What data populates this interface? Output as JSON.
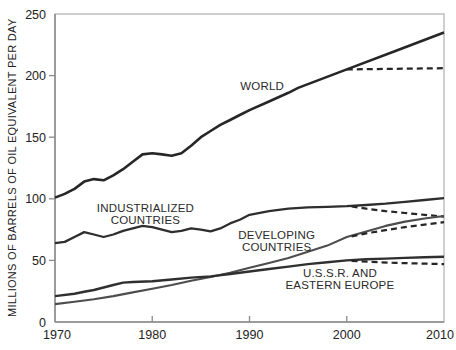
{
  "chart_data": {
    "type": "line",
    "title": "",
    "xlabel": "",
    "ylabel": "MILLIONS OF BARRELS OF OIL EQUIVALENT PER DAY",
    "xlim": [
      1970,
      2010
    ],
    "ylim": [
      0,
      250
    ],
    "x_ticks": [
      1970,
      1980,
      1990,
      2000,
      2010
    ],
    "y_ticks": [
      0,
      50,
      100,
      150,
      200,
      250
    ],
    "grid": false,
    "legend_position": "inline-annotations",
    "axis_color": "#8a8a8a",
    "border_color": "#a8a8a8",
    "series": [
      {
        "name": "WORLD",
        "style": "solid",
        "color": "#262626",
        "width": 2.6,
        "points": [
          [
            1970,
            101
          ],
          [
            1971,
            104
          ],
          [
            1972,
            108
          ],
          [
            1973,
            114
          ],
          [
            1974,
            116
          ],
          [
            1975,
            115
          ],
          [
            1976,
            119
          ],
          [
            1977,
            124
          ],
          [
            1978,
            130
          ],
          [
            1979,
            136
          ],
          [
            1980,
            137
          ],
          [
            1981,
            136
          ],
          [
            1982,
            135
          ],
          [
            1983,
            137
          ],
          [
            1984,
            143
          ],
          [
            1985,
            150
          ],
          [
            1986,
            155
          ],
          [
            1987,
            160
          ],
          [
            1988,
            164
          ],
          [
            1989,
            168
          ],
          [
            1990,
            172
          ],
          [
            1992,
            179
          ],
          [
            1994,
            186
          ],
          [
            1995,
            190
          ],
          [
            2000,
            205
          ],
          [
            2005,
            220
          ],
          [
            2010,
            235
          ]
        ]
      },
      {
        "name": "WORLD (projection)",
        "style": "dashed",
        "color": "#262626",
        "width": 2.2,
        "points": [
          [
            2000,
            205
          ],
          [
            2010,
            206
          ]
        ]
      },
      {
        "name": "INDUSTRIALIZED COUNTRIES",
        "style": "solid",
        "color": "#2e2e2e",
        "width": 2.3,
        "points": [
          [
            1970,
            64
          ],
          [
            1971,
            65
          ],
          [
            1972,
            69
          ],
          [
            1973,
            73
          ],
          [
            1974,
            71
          ],
          [
            1975,
            69
          ],
          [
            1976,
            71
          ],
          [
            1977,
            74
          ],
          [
            1978,
            76
          ],
          [
            1979,
            78
          ],
          [
            1980,
            77
          ],
          [
            1981,
            75
          ],
          [
            1982,
            73
          ],
          [
            1983,
            74
          ],
          [
            1984,
            76
          ],
          [
            1985,
            75
          ],
          [
            1986,
            73.5
          ],
          [
            1987,
            76
          ],
          [
            1988,
            80
          ],
          [
            1989,
            83
          ],
          [
            1990,
            87
          ],
          [
            1992,
            90
          ],
          [
            1994,
            92
          ],
          [
            1996,
            93
          ],
          [
            1998,
            93.5
          ],
          [
            2000,
            94
          ],
          [
            2002,
            95
          ],
          [
            2004,
            96
          ],
          [
            2006,
            97.5
          ],
          [
            2008,
            99
          ],
          [
            2010,
            100.5
          ]
        ]
      },
      {
        "name": "INDUSTRIALIZED COUNTRIES (projection)",
        "style": "dashed",
        "color": "#262626",
        "width": 2.2,
        "points": [
          [
            2000.5,
            93.8
          ],
          [
            2002,
            92
          ],
          [
            2004,
            90
          ],
          [
            2006,
            88.5
          ],
          [
            2008,
            87
          ],
          [
            2010,
            85.5
          ]
        ]
      },
      {
        "name": "DEVELOPING COUNTRIES",
        "style": "solid",
        "color": "#4d4d4d",
        "width": 2.1,
        "points": [
          [
            1970,
            14.5
          ],
          [
            1972,
            16.5
          ],
          [
            1974,
            18.5
          ],
          [
            1976,
            21
          ],
          [
            1978,
            24
          ],
          [
            1980,
            27
          ],
          [
            1982,
            30
          ],
          [
            1984,
            33.5
          ],
          [
            1986,
            36.5
          ],
          [
            1988,
            40
          ],
          [
            1990,
            44
          ],
          [
            1992,
            48
          ],
          [
            1994,
            52
          ],
          [
            1996,
            57
          ],
          [
            1998,
            62
          ],
          [
            2000,
            69
          ],
          [
            2002,
            73.5
          ],
          [
            2004,
            78
          ],
          [
            2006,
            81.5
          ],
          [
            2008,
            84
          ],
          [
            2010,
            86
          ]
        ]
      },
      {
        "name": "DEVELOPING COUNTRIES (projection)",
        "style": "dashed",
        "color": "#262626",
        "width": 2.2,
        "points": [
          [
            2000.5,
            69.5
          ],
          [
            2002,
            72
          ],
          [
            2004,
            74.5
          ],
          [
            2006,
            77
          ],
          [
            2008,
            79
          ],
          [
            2010,
            81
          ]
        ]
      },
      {
        "name": "U.S.S.R. AND EASTERN EUROPE",
        "style": "solid",
        "color": "#2f2f2f",
        "width": 2.4,
        "points": [
          [
            1970,
            21
          ],
          [
            1972,
            23
          ],
          [
            1973,
            24.5
          ],
          [
            1974,
            26
          ],
          [
            1976,
            30
          ],
          [
            1977,
            32
          ],
          [
            1978,
            32.5
          ],
          [
            1980,
            33
          ],
          [
            1982,
            34.5
          ],
          [
            1984,
            36
          ],
          [
            1986,
            37
          ],
          [
            1988,
            39
          ],
          [
            1990,
            41
          ],
          [
            1992,
            43
          ],
          [
            1994,
            45
          ],
          [
            1996,
            47
          ],
          [
            1998,
            48.5
          ],
          [
            2000,
            50
          ],
          [
            2002,
            51
          ],
          [
            2004,
            51.5
          ],
          [
            2006,
            52
          ],
          [
            2008,
            52.5
          ],
          [
            2010,
            53
          ]
        ]
      },
      {
        "name": "U.S.S.R. AND EASTERN EUROPE (projection)",
        "style": "dashed",
        "color": "#262626",
        "width": 2.2,
        "points": [
          [
            2000.5,
            49.5
          ],
          [
            2005,
            48
          ],
          [
            2010,
            47
          ]
        ]
      }
    ],
    "annotations": [
      {
        "lines": [
          "WORLD"
        ],
        "x": 1991.3,
        "y": 192
      },
      {
        "lines": [
          "INDUSTRIALIZED",
          "COUNTRIES"
        ],
        "x": 1979.3,
        "y": 88
      },
      {
        "lines": [
          "DEVELOPING",
          "COUNTRIES"
        ],
        "x": 1992.8,
        "y": 66
      },
      {
        "lines": [
          "U.S.S.R. AND",
          "EASTERN EUROPE"
        ],
        "x": 1999.3,
        "y": 35
      }
    ],
    "text_color": "#222222"
  }
}
